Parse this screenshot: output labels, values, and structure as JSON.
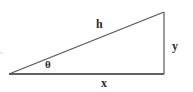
{
  "figure": {
    "kind": "right-triangle-trigonometry-diagram",
    "background_color": "#ffffff",
    "stroke_color": "#4a4a4a",
    "base_stroke_color": "#2e2e2e",
    "label_color": "#2b2b2b",
    "width": 193,
    "height": 92
  },
  "labels": {
    "hypotenuse": "h",
    "opposite": "y",
    "adjacent": "x",
    "angle": "θ"
  },
  "geometry": {
    "vertex_left": {
      "x": 9,
      "y": 74
    },
    "vertex_bottom_right": {
      "x": 164,
      "y": 74
    },
    "vertex_top_right": {
      "x": 164,
      "y": 12
    },
    "sides": [
      {
        "name": "adjacent",
        "label": "x",
        "from": "vertex_left",
        "to": "vertex_bottom_right"
      },
      {
        "name": "opposite",
        "label": "y",
        "from": "vertex_bottom_right",
        "to": "vertex_top_right"
      },
      {
        "name": "hypotenuse",
        "label": "h",
        "from": "vertex_left",
        "to": "vertex_top_right"
      }
    ]
  }
}
